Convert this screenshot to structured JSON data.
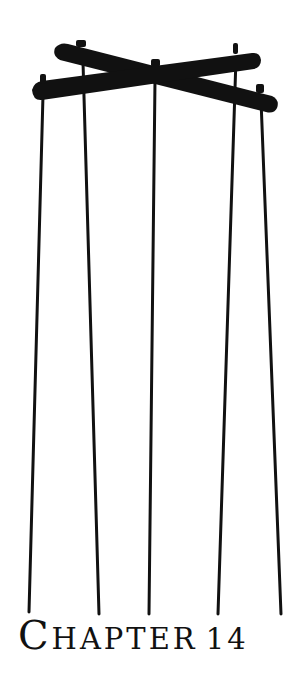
{
  "heading": {
    "first_letter": "C",
    "rest": "HAPTER",
    "number": "14"
  },
  "illustration": {
    "name": "marionette-control-bar",
    "ink_color": "#111111"
  }
}
